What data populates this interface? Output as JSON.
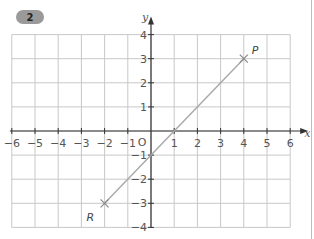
{
  "badge": {
    "label": "2"
  },
  "chart_data": {
    "type": "line",
    "title": "",
    "xlabel": "x",
    "ylabel": "y",
    "xlim": [
      -6,
      6
    ],
    "ylim": [
      -4,
      4
    ],
    "grid": true,
    "x_ticks": [
      "-6",
      "-5",
      "-4",
      "-3",
      "-2",
      "-1",
      "1",
      "2",
      "3",
      "4",
      "5",
      "6"
    ],
    "y_ticks": [
      "4",
      "3",
      "2",
      "1",
      "-1",
      "-2",
      "-3",
      "-4"
    ],
    "origin_label": "O",
    "series": [
      {
        "name": "Line RP",
        "x": [
          -2,
          4
        ],
        "y": [
          -3,
          3
        ],
        "equation": "y = x - 1"
      }
    ],
    "points": [
      {
        "label": "P",
        "x": 4,
        "y": 3
      },
      {
        "label": "R",
        "x": -2,
        "y": -3
      }
    ],
    "colors": {
      "grid": "#c8c8c8",
      "axis": "#333333",
      "line": "#a8a8a8",
      "badge": "#9a9a9a"
    }
  }
}
